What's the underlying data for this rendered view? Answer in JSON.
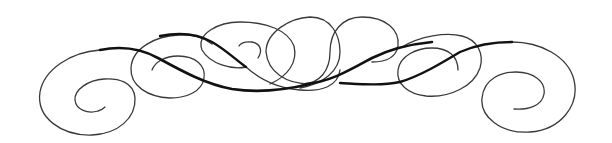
{
  "image": {
    "description": "Symmetric calligraphic flourish divider with spiral ends and interlocking loops",
    "background": "#ffffff",
    "ink_color": "#111111",
    "thin_color": "#3a3a3a",
    "width": 612,
    "height": 143
  },
  "strokes": {
    "left_spiral_outer": "M 100 50 C 70 52, 44 70, 40 92 C 36 118, 62 136, 92 135 C 118 134, 136 118, 135 98 C 134 82, 118 78, 104 79 C 88 80, 74 90, 75 100 C 76 110, 88 114, 98 111 C 102 110, 104 108, 105 107",
    "left_main_thick": "M 100 50 C 120 46, 140 48, 158 58 C 180 70, 205 84, 232 89 C 258 93, 285 90, 310 84",
    "left_main_thick_width": 2.6,
    "left_loop2": "M 152 70 C 155 62, 165 56, 178 56 C 196 56, 206 66, 204 78 C 202 92, 186 98, 170 98 C 148 97, 130 86, 131 68 C 132 48, 156 36, 178 35 C 196 34, 204 38, 212 44",
    "left_upper_thick": "M 160 36 C 180 32, 198 34, 212 42 C 226 50, 236 60, 246 67",
    "left_upper_thick_width": 2.4,
    "left_loop3": "M 246 67 C 256 76, 274 88, 300 90 C 322 92, 338 86, 340 70",
    "left_loop3_ellipse": "M 258 58 C 262 52, 262 44, 252 42 C 244 41, 240 44, 239 46",
    "left_loop3_outer": "M 246 67 C 232 70, 210 64, 202 50 C 196 34, 218 22, 240 22 C 266 22, 288 30, 294 46 C 298 62, 288 76, 270 84",
    "center_loop_left": "M 310 84 C 286 84, 268 72, 266 52 C 266 32, 290 18, 310 17 C 332 17, 340 36, 340 52 C 340 72, 322 84, 300 88",
    "center_loop_right": "M 302 84 C 320 84, 330 70, 330 52 C 330 32, 342 17, 362 17 C 386 17, 400 30, 398 46 C 396 58, 386 62, 372 62",
    "right_main_thick": "M 306 84 C 330 82, 350 70, 372 58 C 392 48, 412 44, 432 42",
    "right_main_thick_width": 2.6,
    "right_loop_thick": "M 340 83 C 360 84, 380 86, 400 82 C 420 76, 440 64, 460 52 C 478 44, 496 42, 512 42",
    "right_loop_thick_width": 2.4,
    "right_loop6": "M 402 47 C 420 36, 446 32, 462 36 C 478 40, 484 54, 480 68 C 474 86, 450 98, 426 96 C 408 94, 396 84, 398 70 C 400 56, 416 48, 432 48 C 448 48, 458 56, 458 70",
    "right_spiral_outer": "M 512 42 C 540 42, 568 56, 574 80 C 580 106, 560 130, 530 132 C 500 134, 480 116, 482 98 C 484 78, 502 72, 516 72 C 534 72, 546 82, 544 94 C 542 106, 528 110, 514 109",
    "left_hook2": "M 152 68 C 154 64, 158 62, 160 62"
  },
  "icons": {
    "ornament": "flourish-divider-icon"
  }
}
